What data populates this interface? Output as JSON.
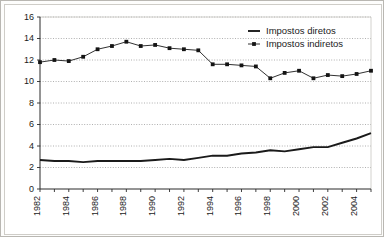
{
  "chart_data": {
    "type": "line",
    "title": "",
    "subtitle": "",
    "xlabel": "",
    "ylabel": "",
    "grid": true,
    "legend_position": "top-right",
    "xlim": [
      1982,
      2005
    ],
    "ylim": [
      0,
      16
    ],
    "ytick_values": [
      0,
      2,
      4,
      6,
      8,
      10,
      12,
      14,
      16
    ],
    "ytick_labels": [
      "0",
      "2",
      "4",
      "6",
      "8",
      "10",
      "12",
      "14",
      "16"
    ],
    "xtick_values": [
      1982,
      1984,
      1986,
      1988,
      1990,
      1992,
      1994,
      1996,
      1998,
      2000,
      2002,
      2004
    ],
    "xtick_labels": [
      "1982",
      "1984",
      "1986",
      "1988",
      "1990",
      "1992",
      "1994",
      "1996",
      "1998",
      "2000",
      "2002",
      "2004"
    ],
    "x": [
      1982,
      1983,
      1984,
      1985,
      1986,
      1987,
      1988,
      1989,
      1990,
      1991,
      1992,
      1993,
      1994,
      1995,
      1996,
      1997,
      1998,
      1999,
      2000,
      2001,
      2002,
      2003,
      2004,
      2005
    ],
    "series": [
      {
        "name": "Impostos diretos",
        "marker": "none",
        "values": [
          2.7,
          2.6,
          2.6,
          2.5,
          2.6,
          2.6,
          2.6,
          2.6,
          2.7,
          2.8,
          2.7,
          2.9,
          3.1,
          3.1,
          3.3,
          3.4,
          3.6,
          3.5,
          3.7,
          3.9,
          3.9,
          4.3,
          4.7,
          5.2
        ]
      },
      {
        "name": "Impostos indiretos",
        "marker": "square",
        "values": [
          11.8,
          12.0,
          11.9,
          12.3,
          13.0,
          13.3,
          13.7,
          13.3,
          13.4,
          13.1,
          13.0,
          12.9,
          11.6,
          11.6,
          11.5,
          11.4,
          10.3,
          10.8,
          11.0,
          10.3,
          10.6,
          10.5,
          10.7,
          11.0
        ]
      }
    ]
  },
  "legend": {
    "items": [
      {
        "label": "Impostos diretos",
        "symbol": "line"
      },
      {
        "label": "Impostos indiretos",
        "symbol": "line-marker"
      }
    ]
  },
  "colors": {
    "series_line": "#1a1a1a",
    "marker": "#141414",
    "grid": "#8e8e8e",
    "axis": "#2b2b2b",
    "frame": "#b9b7b2",
    "background": "#ffffff"
  }
}
